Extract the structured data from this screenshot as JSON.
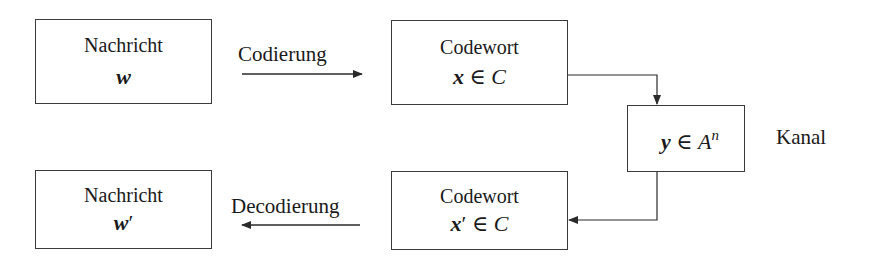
{
  "diagram": {
    "nodes": [
      {
        "id": "message",
        "title": "Nachricht",
        "symbol": "w",
        "prime": "",
        "rel": "",
        "set": "",
        "sup": ""
      },
      {
        "id": "codeword",
        "title": "Codewort",
        "symbol": "x",
        "prime": "",
        "rel": " ∈ ",
        "set": "C",
        "sup": ""
      },
      {
        "id": "channel",
        "title": "",
        "symbol": "y",
        "prime": "",
        "rel": " ∈ ",
        "set": "A",
        "sup": "n"
      },
      {
        "id": "message_out",
        "title": "Nachricht",
        "symbol": "w",
        "prime": "′",
        "rel": "",
        "set": "",
        "sup": ""
      },
      {
        "id": "codeword_out",
        "title": "Codewort",
        "symbol": "x",
        "prime": "′",
        "rel": " ∈ ",
        "set": "C",
        "sup": ""
      }
    ],
    "edges": [
      {
        "from": "message",
        "to": "codeword",
        "label": "Codierung"
      },
      {
        "from": "codeword",
        "to": "channel",
        "label": ""
      },
      {
        "from": "channel",
        "to": "codeword_out",
        "label": ""
      },
      {
        "from": "codeword_out",
        "to": "message_out",
        "label": "Decodierung"
      }
    ],
    "side_label": "Kanal",
    "colors": {
      "stroke": "#3a3a3a",
      "text": "#1a1a1a",
      "background": "#ffffff"
    }
  }
}
